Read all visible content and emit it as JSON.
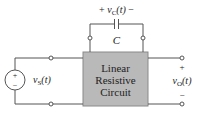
{
  "diagram": {
    "type": "circuit",
    "source": {
      "label_main": "v",
      "label_sub": "S",
      "label_arg": "(t)",
      "plus": "+",
      "minus": "−"
    },
    "capacitor": {
      "label": "C",
      "voltage_plus": "+",
      "voltage_main": "v",
      "voltage_sub": "C",
      "voltage_arg": "(t)",
      "voltage_minus": "−"
    },
    "block": {
      "line1": "Linear",
      "line2": "Resistive",
      "line3": "Circuit",
      "fill": "#b9b9b9"
    },
    "output": {
      "plus": "+",
      "minus": "−",
      "label_main": "v",
      "label_sub": "O",
      "label_arg": "(t)"
    },
    "colors": {
      "wire": "#555555",
      "block_fill": "#b9b9b9",
      "block_border": "#777777"
    }
  }
}
